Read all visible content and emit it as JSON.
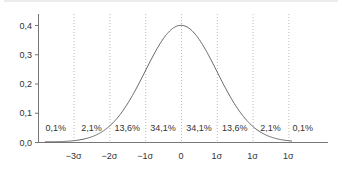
{
  "chart_data": {
    "type": "line",
    "title": "",
    "xlabel": "",
    "ylabel": "",
    "ylim": [
      0,
      0.4
    ],
    "y_ticks": [
      "0,0",
      "0,1",
      "0,2",
      "0,3",
      "0,4"
    ],
    "x_ticks": [
      "−3σ",
      "−2σ",
      "−1σ",
      "0",
      "1σ",
      "1σ",
      "1σ"
    ],
    "grid": "vertical dotted lines at each σ",
    "series": [
      {
        "name": "normal density",
        "x": [
          -4,
          -3,
          -2.5,
          -2,
          -1.5,
          -1,
          -0.5,
          0,
          0.5,
          1,
          1.5,
          2,
          2.5,
          3
        ],
        "values": [
          0.0001,
          0.0044,
          0.0175,
          0.054,
          0.1295,
          0.242,
          0.3521,
          0.3989,
          0.3521,
          0.242,
          0.1295,
          0.054,
          0.0175,
          0.0044
        ]
      }
    ],
    "band_labels": [
      "0,1%",
      "2,1%",
      "13,6%",
      "34,1%",
      "34,1%",
      "13,6%",
      "2,1%",
      "0,1%"
    ]
  }
}
